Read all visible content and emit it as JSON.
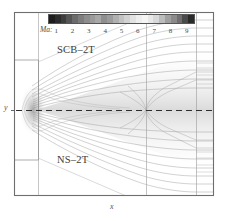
{
  "figure": {
    "type": "cfd-contour-comparison",
    "background": "#ffffff",
    "frame_color": "#6e6e6e",
    "width": 228,
    "height": 221
  },
  "colorbar": {
    "name": "Ma",
    "label": "Ma:",
    "orientation": "horizontal",
    "x": 48,
    "y": 14,
    "width": 147,
    "height": 10,
    "border_color": "#555555",
    "scale": "grayscale-discrete",
    "min": 0.5,
    "max": 9.5,
    "tick_labels": [
      "1",
      "2",
      "3",
      "4",
      "5",
      "6",
      "7",
      "8",
      "9"
    ],
    "tick_values": [
      1,
      2,
      3,
      4,
      5,
      6,
      7,
      8,
      9
    ],
    "band_colors": [
      "#1c1c1c",
      "#2b2b2b",
      "#3d3d3d",
      "#555555",
      "#6b6b6b",
      "#7d7d7d",
      "#8d8d8d",
      "#9b9b9b",
      "#a8a8a8",
      "#8f8f8f",
      "#9c9c9c",
      "#b0b0b0",
      "#c2c2c2",
      "#d2d2d2",
      "#e2e2e2",
      "#eeeeee",
      "#f5f5f5",
      "#e8e8e8",
      "#d8d8d8",
      "#bcbcbc",
      "#a0a0a0",
      "#8a8a8a",
      "#6f6f6f",
      "#4a4a4a",
      "#2a2a2a"
    ]
  },
  "labels": {
    "upper_region": "SCB–2T",
    "lower_region": "NS–2T",
    "y_axis": "y",
    "x_axis": "x"
  },
  "chart_data": {
    "type": "contour",
    "title": "",
    "xlabel": "x",
    "ylabel": "y",
    "colorbar_label": "Ma",
    "colorbar_ticks": [
      1,
      2,
      3,
      4,
      5,
      6,
      7,
      8,
      9
    ],
    "legend_position": "top",
    "grid": false,
    "symmetry": "mirrored-about-centerline",
    "centerline_style": "dashed",
    "series": [
      {
        "name": "SCB–2T",
        "region": "upper-half"
      },
      {
        "name": "NS–2T",
        "region": "lower-half"
      }
    ],
    "annotations": [
      "SCB–2T",
      "NS–2T"
    ],
    "vertical_gridlines_x": [
      38,
      146,
      196
    ],
    "contour_count_per_half": 9
  }
}
